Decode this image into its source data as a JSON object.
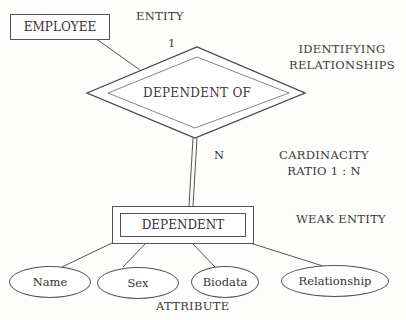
{
  "diagram": {
    "type": "ER diagram",
    "entities": {
      "employee": "EMPLOYEE",
      "dependent": "DEPENDENT"
    },
    "relationship": "DEPENDENT OF",
    "cardinality": {
      "one": "1",
      "many": "N"
    },
    "attributes": [
      "Name",
      "Sex",
      "Biodata",
      "Relationship"
    ],
    "annotations": {
      "entity": "ENTITY",
      "identifying_1": "IDENTIFYING",
      "identifying_2": "RELATIONSHIPS",
      "cardinality_1": "CARDINACITY",
      "cardinality_2": "RATIO 1 : N",
      "weak_entity": "WEAK ENTITY",
      "attribute": "ATTRIBUTE"
    }
  }
}
